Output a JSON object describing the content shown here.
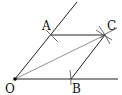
{
  "diagram": {
    "type": "geometric-construction",
    "colors": {
      "line": "#222222",
      "diagonal": "#666666",
      "arc": "#444444",
      "point": "#000000"
    },
    "points": {
      "O": {
        "label": "O",
        "x": 15,
        "y": 79
      },
      "A": {
        "label": "A",
        "x": 51,
        "y": 35
      },
      "B": {
        "label": "B",
        "x": 71,
        "y": 79
      },
      "C": {
        "label": "C",
        "x": 105,
        "y": 35
      }
    },
    "segments": [
      {
        "from": "O",
        "to": "ray-up-end",
        "name": "ray-OA"
      },
      {
        "from": "O",
        "to": "ray-right-end",
        "name": "ray-OB"
      },
      {
        "from": "A",
        "to": "C",
        "name": "segment-AC"
      },
      {
        "from": "B",
        "to": "C",
        "name": "segment-BC"
      },
      {
        "from": "O",
        "to": "C",
        "name": "diagonal-OC"
      }
    ]
  }
}
